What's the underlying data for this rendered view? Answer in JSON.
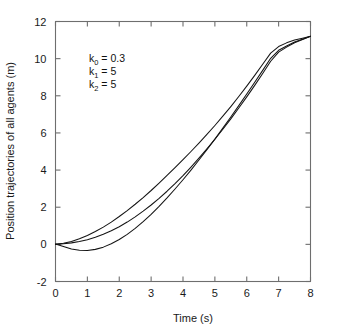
{
  "figure": {
    "background_color": "#ffffff",
    "frame_color": "#6e6e6e",
    "line_color": "#141414"
  },
  "annotation": {
    "line1_base": "k",
    "line1_sub": "0",
    "line1_rest": " = 0.3",
    "line2_base": "k",
    "line2_sub": "1",
    "line2_rest": " = 5",
    "line3_base": "k",
    "line3_sub": "2",
    "line3_rest": " = 5"
  },
  "chart_data": {
    "type": "line",
    "title": "",
    "xlabel": "Time (s)",
    "ylabel": "Position trajectories of all agents (m)",
    "xlim": [
      0,
      8
    ],
    "ylim": [
      -2,
      12
    ],
    "xticks": [
      0,
      1,
      2,
      3,
      4,
      5,
      6,
      7,
      8
    ],
    "xtick_labels": [
      "0",
      "1",
      "2",
      "3",
      "4",
      "5",
      "6",
      "7",
      "8"
    ],
    "yticks": [
      -2,
      0,
      2,
      4,
      6,
      8,
      10,
      12
    ],
    "ytick_labels": [
      "-2",
      "0",
      "2",
      "4",
      "6",
      "8",
      "10",
      "12"
    ],
    "grid": false,
    "legend": false,
    "ticks_direction": "in",
    "frame": "box",
    "annotations": [
      {
        "text": "k0 = 0.3",
        "x": 1.1,
        "y": 9.2
      },
      {
        "text": "k1 = 5",
        "x": 1.1,
        "y": 8.4
      },
      {
        "text": "k2 = 5",
        "x": 1.1,
        "y": 7.6
      }
    ],
    "x": [
      0,
      0.25,
      0.5,
      0.75,
      1,
      1.25,
      1.5,
      1.75,
      2,
      2.25,
      2.5,
      2.75,
      3,
      3.25,
      3.5,
      3.75,
      4,
      4.25,
      4.5,
      4.75,
      5,
      5.25,
      5.5,
      5.75,
      6,
      6.25,
      6.5,
      6.75,
      7,
      7.25,
      7.5,
      7.75,
      8
    ],
    "series": [
      {
        "name": "agent-1",
        "values": [
          0.02,
          -0.12,
          -0.25,
          -0.32,
          -0.33,
          -0.27,
          -0.15,
          0.03,
          0.26,
          0.54,
          0.86,
          1.22,
          1.62,
          2.05,
          2.5,
          2.98,
          3.48,
          4.0,
          4.54,
          5.1,
          5.67,
          6.26,
          6.86,
          7.47,
          8.1,
          8.73,
          9.37,
          10.02,
          10.45,
          10.68,
          10.9,
          11.05,
          11.2
        ]
      },
      {
        "name": "agent-2",
        "values": [
          0.0,
          0.03,
          0.08,
          0.15,
          0.25,
          0.38,
          0.54,
          0.73,
          0.95,
          1.2,
          1.48,
          1.79,
          2.12,
          2.48,
          2.86,
          3.27,
          3.7,
          4.16,
          4.64,
          5.14,
          5.66,
          6.2,
          6.76,
          7.34,
          7.94,
          8.56,
          9.2,
          9.86,
          10.35,
          10.62,
          10.86,
          11.03,
          11.2
        ]
      },
      {
        "name": "agent-3",
        "values": [
          0.0,
          0.06,
          0.16,
          0.3,
          0.48,
          0.69,
          0.93,
          1.2,
          1.5,
          1.82,
          2.16,
          2.52,
          2.9,
          3.3,
          3.71,
          4.13,
          4.56,
          5.0,
          5.45,
          5.92,
          6.4,
          6.9,
          7.42,
          7.96,
          8.52,
          9.1,
          9.7,
          10.3,
          10.65,
          10.85,
          11.0,
          11.1,
          11.2
        ]
      }
    ]
  }
}
